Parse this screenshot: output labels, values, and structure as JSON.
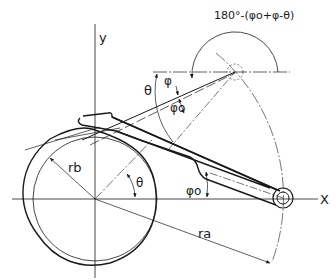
{
  "diagram": {
    "type": "cam-follower geometry",
    "top_cutoff_text": "",
    "labels": {
      "y_axis": "y",
      "x_axis": "X",
      "angle_expression": "180°-(φo+φ-θ)",
      "theta_upper": "θ",
      "phi": "φ",
      "phi_o_upper": "φo",
      "r_b": "rb",
      "theta_lower": "θ",
      "phi_o_lower": "φo",
      "r_a": "ra"
    },
    "colors": {
      "ink": "#1a1a1a",
      "background": "#ffffff"
    }
  }
}
